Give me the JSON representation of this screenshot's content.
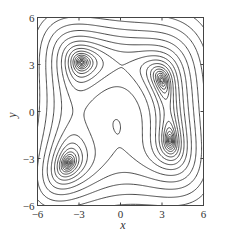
{
  "chart_data": {
    "type": "contour",
    "title": "",
    "function": "Himmelblau: f(x,y) = (x^2 + y - 11)^2 + (x + y^2 - 7)^2",
    "xlabel": "x",
    "ylabel": "y",
    "xlim": [
      -6,
      6
    ],
    "ylim": [
      -6,
      6
    ],
    "xticks": [
      -6,
      -3,
      0,
      3,
      6
    ],
    "yticks": [
      -6,
      -3,
      0,
      3,
      6
    ],
    "xtick_labels": [
      "−6",
      "−3",
      "0",
      "3",
      "6"
    ],
    "ytick_labels": [
      "−6",
      "−3",
      "0",
      "3",
      "6"
    ],
    "grid": false,
    "legend": null,
    "minima": [
      {
        "x": 3.0,
        "y": 2.0
      },
      {
        "x": -2.805,
        "y": 3.131
      },
      {
        "x": -3.779,
        "y": -3.283
      },
      {
        "x": 3.584,
        "y": -1.848
      }
    ],
    "contour_levels": [
      0.3,
      0.8,
      1.8,
      3.5,
      6,
      10,
      16,
      26,
      42,
      68,
      110,
      180,
      290,
      460,
      720,
      1100,
      1700,
      2600
    ],
    "line_color": "#2a2a2a"
  },
  "axes": {
    "x_label": "x",
    "y_label": "y"
  }
}
